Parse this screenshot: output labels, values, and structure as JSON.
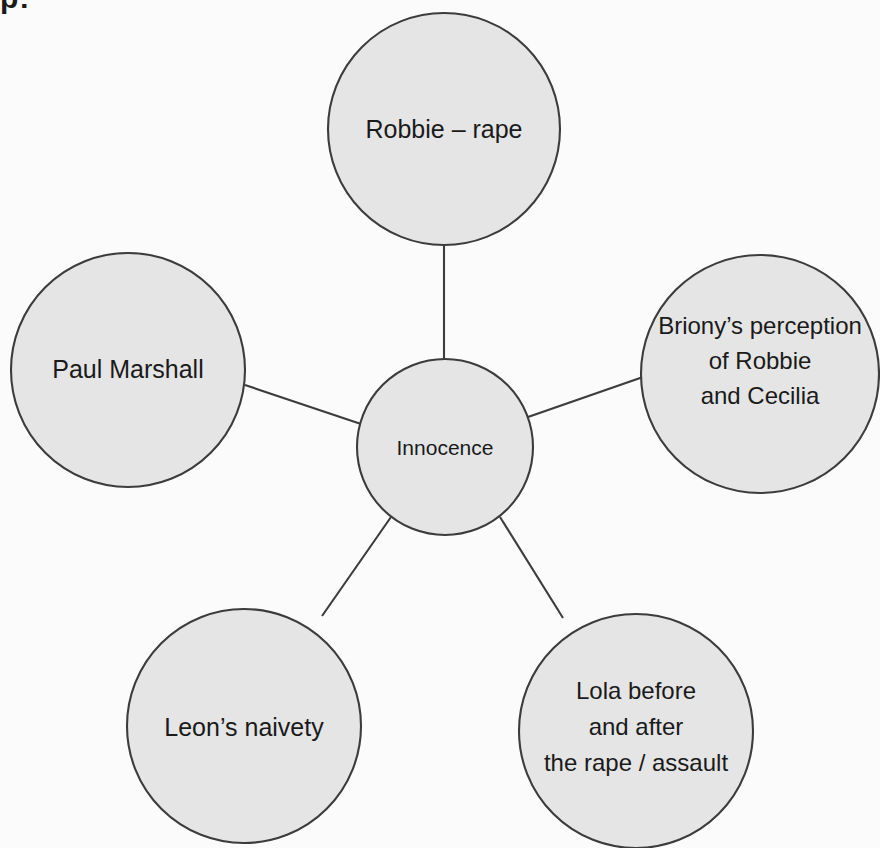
{
  "page": {
    "fragment_top_left": "p:",
    "background_color": "#fbfbfb",
    "node_fill_color": "#e5e5e5",
    "node_stroke_color": "#3c3c3c",
    "text_color": "#1a1a1a"
  },
  "diagram": {
    "type": "mind-map",
    "center": {
      "id": "innocence",
      "label": "Innocence",
      "cx": 445,
      "cy": 447,
      "r": 88
    },
    "nodes": [
      {
        "id": "robbie-rape",
        "label": "Robbie – rape",
        "lines": [
          "Robbie – rape"
        ],
        "cx": 444,
        "cy": 129,
        "r": 116,
        "position": "top"
      },
      {
        "id": "brionys-perception",
        "label": "Briony’s perception of Robbie and Cecilia",
        "lines": [
          "Briony’s perception",
          "of Robbie",
          "and Cecilia"
        ],
        "cx": 760,
        "cy": 374,
        "r": 119,
        "position": "right"
      },
      {
        "id": "paul-marshall",
        "label": "Paul Marshall",
        "lines": [
          "Paul Marshall"
        ],
        "cx": 128,
        "cy": 370,
        "r": 117,
        "position": "left"
      },
      {
        "id": "leons-naivety",
        "label": "Leon’s naivety",
        "lines": [
          "Leon’s naivety"
        ],
        "cx": 244,
        "cy": 726,
        "r": 117,
        "position": "bottom-left"
      },
      {
        "id": "lola-before-after",
        "label": "Lola before and after the rape / assault",
        "lines": [
          "Lola before",
          "and after",
          "the rape / assault"
        ],
        "cx": 636,
        "cy": 731,
        "r": 117,
        "position": "bottom-right"
      }
    ],
    "connectors": [
      {
        "id": "center-to-robbie",
        "from": "innocence",
        "to": "robbie-rape",
        "x1": 444,
        "y1": 359,
        "x2": 444,
        "y2": 246
      },
      {
        "id": "center-to-briony",
        "from": "innocence",
        "to": "brionys-perception",
        "x1": 528,
        "y1": 417,
        "x2": 643,
        "y2": 377
      },
      {
        "id": "center-to-paul",
        "from": "innocence",
        "to": "paul-marshall",
        "x1": 361,
        "y1": 424,
        "x2": 245,
        "y2": 385
      },
      {
        "id": "center-to-leon",
        "from": "innocence",
        "to": "leons-naivety",
        "x1": 391,
        "y1": 517,
        "x2": 322,
        "y2": 616
      },
      {
        "id": "center-to-lola",
        "from": "innocence",
        "to": "lola-before-after",
        "x1": 500,
        "y1": 517,
        "x2": 563,
        "y2": 618
      }
    ]
  }
}
